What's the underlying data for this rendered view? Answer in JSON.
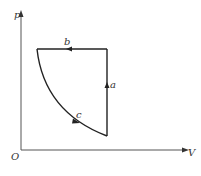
{
  "diagram": {
    "type": "p-V thermodynamic cycle",
    "axes": {
      "y_label": "p",
      "x_label": "V",
      "origin_label": "O"
    },
    "processes": [
      {
        "id": "b",
        "label": "b",
        "kind": "isobaric",
        "direction": "leftward (volume decreasing)"
      },
      {
        "id": "c",
        "label": "c",
        "kind": "curve (isothermal-like)",
        "direction": "down-right (volume increasing, pressure decreasing)"
      },
      {
        "id": "a",
        "label": "a",
        "kind": "isochoric",
        "direction": "upward (pressure increasing)"
      }
    ],
    "colors": {
      "line": "#222222",
      "axis": "#555555",
      "background": "#ffffff"
    }
  }
}
